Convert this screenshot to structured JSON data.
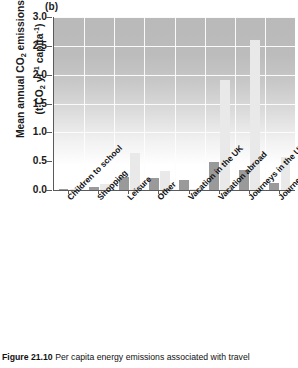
{
  "panel": {
    "label": "(b)"
  },
  "axis": {
    "y_title_line1": "Mean annual CO2 emissions",
    "y_title_line2": "(t CO2 yr-1 capita-1)",
    "y_title_plain": "Mean annual CO₂ emissions (t CO₂ yr⁻¹ capita⁻¹)",
    "y_ticks": [
      "0.0",
      "0.5",
      "1.0",
      "1.5",
      "2.0",
      "2.5",
      "3.0"
    ]
  },
  "caption": {
    "figure_number": "Figure 21.10",
    "text": "Per capita energy emissions associated with travel"
  },
  "colors": {
    "bar_dark": "#9a9a9a",
    "bar_light": "#e9e9e9",
    "axis": "#5a5a5a",
    "gridline": "#fdfdfd",
    "plot_top": "#b9b9b9",
    "plot_bottom": "#ffffff"
  },
  "chart_data": {
    "type": "bar",
    "title": "(b)",
    "xlabel": "",
    "ylabel": "Mean annual CO2 emissions (t CO2 yr-1 capita-1)",
    "ylim": [
      0,
      3.0
    ],
    "ytick_values": [
      0.0,
      0.5,
      1.0,
      1.5,
      2.0,
      2.5,
      3.0
    ],
    "grid": true,
    "legend": "none",
    "categories": [
      "Children to school",
      "Shopping",
      "Leisure",
      "Other",
      "Vacation in the UK",
      "Vacation abroad",
      "Journeys in the UK for professional reasons",
      "Journeys abroad for professional reasons"
    ],
    "series": [
      {
        "name": "series-dark",
        "values": [
          0.02,
          0.05,
          0.22,
          0.21,
          0.18,
          0.48,
          0.34,
          0.13
        ]
      },
      {
        "name": "series-light",
        "values": [
          0.01,
          0.1,
          0.65,
          0.33,
          0.02,
          1.9,
          2.6,
          0.58
        ]
      }
    ]
  }
}
